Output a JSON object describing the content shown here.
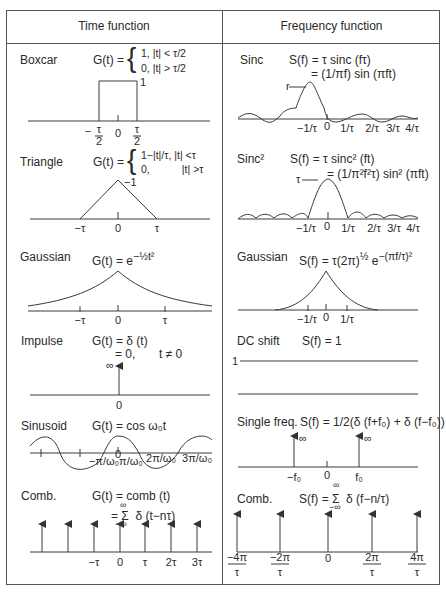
{
  "headers": {
    "time": "Time function",
    "frequency": "Frequency function"
  },
  "rows": [
    {
      "time": {
        "name": "Boxcar",
        "eq_prefix": "G(t) =",
        "eq_line1": "1, |t| < τ/2",
        "eq_line2": "0, |t| > τ/2",
        "peak_label": "1",
        "ticks": [
          "−τ/2",
          "0",
          "τ/2"
        ]
      },
      "freq": {
        "name": "Sinc",
        "eq_line1": "S(f) = τ sinc (fτ)",
        "eq_line2": "= (1/πf) sin (πft)",
        "peak_label": "r",
        "ticks": [
          "−1/τ",
          "0",
          "1/τ",
          "2/τ",
          "3/τ",
          "4/τ"
        ]
      }
    },
    {
      "time": {
        "name": "Triangle",
        "eq_prefix": "G(t) =",
        "eq_line1": "1−|t|/τ, |t| <τ",
        "eq_line2": "0,           |t| >τ",
        "peak_label": "−1",
        "ticks": [
          "−τ",
          "0",
          "τ"
        ]
      },
      "freq": {
        "name": "Sinc²",
        "eq_line1": "S(f) = τ sinc² (ft)",
        "eq_line2": "= (1/π²f²τ) sin² (πft)",
        "peak_label": "τ",
        "ticks": [
          "−1/τ",
          "0",
          "1/τ",
          "2/τ",
          "3/τ",
          "4/τ"
        ]
      }
    },
    {
      "time": {
        "name": "Gaussian",
        "eq": "G(t) = e^(−½t²)",
        "eq_base": "G(t) = e",
        "eq_sup": "−½t²",
        "ticks": [
          "−τ",
          "0",
          "τ"
        ]
      },
      "freq": {
        "name": "Gaussian",
        "eq_base": "S(f) = τ(2π)",
        "eq_sup1": "½",
        "eq_mid": " e",
        "eq_sup2": "−(πf/τ)²",
        "ticks": [
          "−1/τ",
          "0",
          "1/τ"
        ]
      }
    },
    {
      "time": {
        "name": "Impulse",
        "eq_line1": "G(t) = δ (t)",
        "eq_line2": "= 0,",
        "eq_cond": "t ≠ 0",
        "inf_label": "∞",
        "ticks": [
          "0"
        ]
      },
      "freq": {
        "name": "DC shift",
        "eq": "S(f) = 1",
        "level_label": "1"
      }
    },
    {
      "time": {
        "name": "Sinusoid",
        "eq": "G(t) = cos ω₀t",
        "ticks": [
          "−π/ω₀",
          "0",
          "π/ω₀",
          "2π/ω₀",
          "3π/ω₀"
        ]
      },
      "freq": {
        "name": "Single freq.",
        "eq": "S(f) = 1/2(δ (f+f₀) + δ (f−f₀))",
        "inf_label": "∞",
        "ticks": [
          "−f₀",
          "0",
          "f₀"
        ]
      }
    },
    {
      "time": {
        "name": "Comb.",
        "eq_line1": "G(t) = comb (t)",
        "eq_line2": "= Σ  δ (t−nτ)",
        "sum_top": "∞",
        "sum_bot": "−∞",
        "ticks": [
          "−τ",
          "0",
          "τ",
          "2τ",
          "3τ"
        ]
      },
      "freq": {
        "name": "Comb.",
        "eq": "S(f) = Σ  δ (f−n/τ)",
        "sum_top": "∞",
        "sum_bot": "−∞",
        "ticks_num": [
          "−4π",
          "−2π",
          "0",
          "2π",
          "4π"
        ],
        "ticks_den": "τ"
      }
    }
  ],
  "colors": {
    "line": "#3a3a3a",
    "text": "#2a2a2a",
    "border": "#555555"
  }
}
